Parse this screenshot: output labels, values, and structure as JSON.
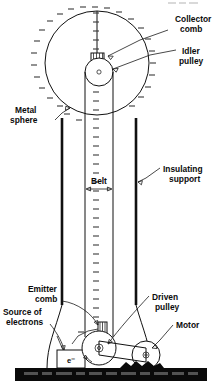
{
  "figure": {
    "background_color": "#ffffff",
    "ink_color": "#111111",
    "width": 222,
    "height": 388
  },
  "labels": {
    "collector_comb": {
      "line1": "Collector",
      "line2": "comb"
    },
    "idler_pulley": {
      "line1": "Idler",
      "line2": "pulley"
    },
    "metal_sphere": {
      "line1": "Metal",
      "line2": "sphere"
    },
    "insulating_support": {
      "line1": "Insulating",
      "line2": "support"
    },
    "belt": {
      "line1": "Belt"
    },
    "emitter_comb": {
      "line1": "Emitter",
      "line2": "comb"
    },
    "source_of_electrons": {
      "line1": "Source of",
      "line2": "electrons"
    },
    "driven_pulley": {
      "line1": "Driven",
      "line2": "pulley"
    },
    "motor": {
      "line1": "Motor"
    },
    "electron_box": {
      "symbol": "e⁻"
    }
  },
  "parts": [
    {
      "name": "metal-sphere",
      "kind": "hollow conducting dome"
    },
    {
      "name": "collector-comb",
      "kind": "comb electrode at top"
    },
    {
      "name": "idler-pulley",
      "kind": "upper pulley"
    },
    {
      "name": "belt",
      "kind": "insulating moving belt"
    },
    {
      "name": "insulating-support",
      "kind": "column"
    },
    {
      "name": "emitter-comb",
      "kind": "comb electrode at bottom"
    },
    {
      "name": "source-of-electrons",
      "kind": "high voltage supply"
    },
    {
      "name": "driven-pulley",
      "kind": "lower pulley"
    },
    {
      "name": "motor",
      "kind": "drive motor with pulley"
    },
    {
      "name": "ground",
      "kind": "earth / floor bar"
    }
  ],
  "charge_symbols": {
    "glyph": "–",
    "meaning": "negative charge marks on sphere surface and belt",
    "color": "#3a3a3a"
  }
}
